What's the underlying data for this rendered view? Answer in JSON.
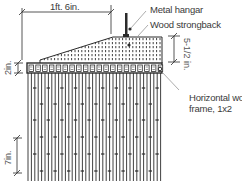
{
  "diagram": {
    "type": "architectural-section",
    "dimensions": {
      "width": "1ft. 6in.",
      "top_height": "5-1/2 in.",
      "band_height": "2in.",
      "slat_spacing": "7in."
    },
    "callouts": [
      {
        "id": "metal-hangar",
        "text": "Metal hangar"
      },
      {
        "id": "wood-strongback",
        "text": "Wood strongback"
      },
      {
        "id": "horizontal-frame-line1",
        "text": "Horizontal wood"
      },
      {
        "id": "horizontal-frame-line2",
        "text": "frame, 1x2"
      }
    ],
    "colors": {
      "line": "#2b2b2b",
      "text": "#3a3a3a",
      "dim": "#555555",
      "background": "#ffffff"
    }
  }
}
